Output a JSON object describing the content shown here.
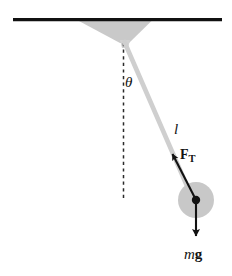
{
  "figure": {
    "width": 232,
    "height": 276,
    "background_color": "#ffffff"
  },
  "labels": {
    "angle": "θ",
    "length": "l",
    "tension_symbol": "F",
    "tension_subscript": "T",
    "weight_mass": "m",
    "weight_gravity": "g"
  },
  "colors": {
    "ceiling": "#111111",
    "bracket_gray": "#c9c9c9",
    "string_gray": "#cfcfcf",
    "bob_gray": "#c8c8c8",
    "vector_black": "#121212",
    "dashed_line": "#2a2a2a",
    "pivot_dot": "#121212"
  },
  "geometry": {
    "ceiling_y": 19,
    "ceiling_x_start": 13,
    "ceiling_x_end": 222,
    "ceiling_thickness": 3.2,
    "bracket_top_left_x": 78,
    "bracket_top_right_x": 152,
    "pivot_x": 124,
    "pivot_y": 41,
    "dashed_bottom_y": 201,
    "bob_center_x": 196,
    "bob_center_y": 200,
    "bob_radius": 18,
    "bob_dot_radius": 4.2,
    "string_width": 4.6,
    "tension_arrow_start_x": 196,
    "tension_arrow_start_y": 200,
    "tension_arrow_end_x": 172,
    "tension_arrow_end_y": 153,
    "weight_arrow_start_y": 200,
    "weight_arrow_end_y": 237
  },
  "elements": {
    "ceiling_name": "ceiling-support-line",
    "bracket_name": "ceiling-shadow-bracket",
    "dashed_name": "vertical-reference-dashed-line",
    "string_name": "pendulum-string",
    "bob_name": "pendulum-bob",
    "pivot_dot_name": "bob-center-point",
    "tension_vector_name": "tension-force-vector",
    "weight_vector_name": "weight-force-vector"
  }
}
